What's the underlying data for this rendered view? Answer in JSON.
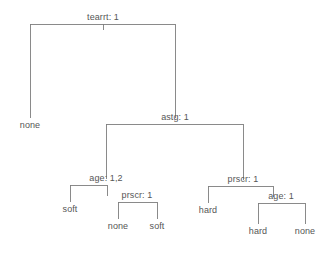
{
  "figure": {
    "type": "decision-tree-diagram",
    "background_color": "#ffffff",
    "line_color": "#7d7d7d",
    "text_color": "#565656",
    "width": 325,
    "height": 254
  },
  "tree": {
    "root": {
      "id": "n-tearrt",
      "label": "tearrt: 1",
      "kind": "decision"
    },
    "internal_nodes": [
      {
        "id": "n-tearrt",
        "label": "tearrt: 1"
      },
      {
        "id": "n-astg",
        "label": "astg: 1"
      },
      {
        "id": "n-age-left",
        "label": "age: 1,2"
      },
      {
        "id": "n-prscr-left",
        "label": "prscr: 1"
      },
      {
        "id": "n-prscr-right",
        "label": "prscr: 1"
      },
      {
        "id": "n-age-right",
        "label": "age: 1"
      }
    ],
    "leaf_nodes": [
      {
        "id": "l-none-1",
        "label": "none"
      },
      {
        "id": "l-soft-1",
        "label": "soft"
      },
      {
        "id": "l-none-2",
        "label": "none"
      },
      {
        "id": "l-soft-2",
        "label": "soft"
      },
      {
        "id": "l-hard-1",
        "label": "hard"
      },
      {
        "id": "l-hard-2",
        "label": "hard"
      },
      {
        "id": "l-none-3",
        "label": "none"
      }
    ],
    "edges": [
      {
        "from": "n-tearrt",
        "to": "l-none-1"
      },
      {
        "from": "n-tearrt",
        "to": "n-astg"
      },
      {
        "from": "n-astg",
        "to": "n-age-left"
      },
      {
        "from": "n-astg",
        "to": "n-prscr-right"
      },
      {
        "from": "n-age-left",
        "to": "l-soft-1"
      },
      {
        "from": "n-age-left",
        "to": "n-prscr-left"
      },
      {
        "from": "n-prscr-left",
        "to": "l-none-2"
      },
      {
        "from": "n-prscr-left",
        "to": "l-soft-2"
      },
      {
        "from": "n-prscr-right",
        "to": "l-hard-1"
      },
      {
        "from": "n-prscr-right",
        "to": "n-age-right"
      },
      {
        "from": "n-age-right",
        "to": "l-hard-2"
      },
      {
        "from": "n-age-right",
        "to": "l-none-3"
      }
    ]
  },
  "labels": {
    "root_tearrt": "tearrt: 1",
    "astg": "astg: 1",
    "age_left": "age: 1,2",
    "prscr_left": "prscr: 1",
    "prscr_right": "prscr: 1",
    "age_right": "age: 1",
    "leaf_none_1": "none",
    "leaf_soft_1": "soft",
    "leaf_none_2": "none",
    "leaf_soft_2": "soft",
    "leaf_hard_1": "hard",
    "leaf_hard_2": "hard",
    "leaf_none_3": "none"
  }
}
